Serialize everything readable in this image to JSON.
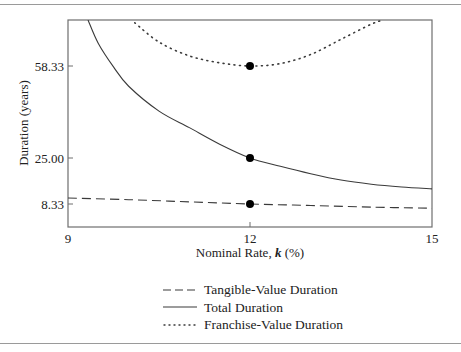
{
  "chart_data": {
    "type": "line",
    "title": "",
    "xlabel": "Nominal Rate, k (%)",
    "xlabel_parts": {
      "prefix": "Nominal Rate, ",
      "var": "k",
      "suffix": " (%)"
    },
    "ylabel": "Duration (years)",
    "xlim": [
      9,
      15
    ],
    "ylim": [
      0,
      75
    ],
    "x_ticks": [
      9,
      12,
      15
    ],
    "x_tick_labels": [
      "9",
      "12",
      "15"
    ],
    "y_ticks": [
      8.33,
      25.0,
      58.33
    ],
    "y_tick_labels": [
      "8.33",
      "25.00",
      "58.33"
    ],
    "grid": false,
    "legend_position": "below",
    "series": [
      {
        "name": "Tangible-Value Duration",
        "style": "dashed",
        "x": [
          9.0,
          10.0,
          11.0,
          12.0,
          13.0,
          14.0,
          15.0
        ],
        "y": [
          10.5,
          9.9,
          9.1,
          8.33,
          7.8,
          7.2,
          6.8
        ]
      },
      {
        "name": "Total Duration",
        "style": "solid",
        "x": [
          9.33,
          9.5,
          9.75,
          10.0,
          10.5,
          11.0,
          11.5,
          12.0,
          12.5,
          13.0,
          13.5,
          14.0,
          14.5,
          15.0
        ],
        "y": [
          75.0,
          66.5,
          58.0,
          51.0,
          42.0,
          36.0,
          30.0,
          25.0,
          22.0,
          19.3,
          17.0,
          15.5,
          14.5,
          13.8
        ]
      },
      {
        "name": "Franchise-Value Duration",
        "style": "dotted",
        "x": [
          10.1,
          10.5,
          11.0,
          11.5,
          12.0,
          12.5,
          13.0,
          13.5,
          14.0,
          14.2
        ],
        "y": [
          74.0,
          67.0,
          62.0,
          59.5,
          58.33,
          59.2,
          62.5,
          68.0,
          73.5,
          75.0
        ]
      }
    ],
    "highlight_points": [
      {
        "series": "Franchise-Value Duration",
        "x": 12,
        "y": 58.33
      },
      {
        "series": "Total Duration",
        "x": 12,
        "y": 25.0
      },
      {
        "series": "Tangible-Value Duration",
        "x": 12,
        "y": 8.33
      }
    ]
  },
  "legend": {
    "items": [
      {
        "label": "Tangible-Value Duration",
        "style": "dashed"
      },
      {
        "label": "Total Duration",
        "style": "solid"
      },
      {
        "label": "Franchise-Value Duration",
        "style": "dotted"
      }
    ]
  },
  "colors": {
    "line": "#3a3a3a",
    "axis": "#6e6e6e",
    "point": "#000000",
    "rule": "#9a9a9a"
  }
}
